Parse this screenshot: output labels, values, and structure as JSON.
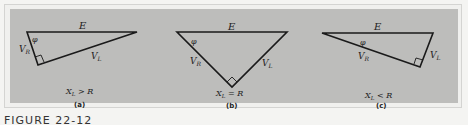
{
  "figure": {
    "caption": "FIGURE 22-12",
    "panels": [
      {
        "id": "a",
        "label": "(a)",
        "condition": "X_L > R",
        "condition_parts": {
          "lhs": "X",
          "sub": "L",
          "op": " > ",
          "rhs": "R"
        },
        "hypotenuse_label": "E",
        "angle_label": "φ",
        "side_labels": {
          "resistive": {
            "main": "V",
            "sub": "R"
          },
          "inductive": {
            "main": "V",
            "sub": "L"
          }
        }
      },
      {
        "id": "b",
        "label": "(b)",
        "condition": "X_L = R",
        "condition_parts": {
          "lhs": "X",
          "sub": "L",
          "op": " = ",
          "rhs": "R"
        },
        "hypotenuse_label": "E",
        "angle_label": "φ",
        "side_labels": {
          "resistive": {
            "main": "V",
            "sub": "R"
          },
          "inductive": {
            "main": "V",
            "sub": "L"
          }
        }
      },
      {
        "id": "c",
        "label": "(c)",
        "condition": "X_L < R",
        "condition_parts": {
          "lhs": "X",
          "sub": "L",
          "op": " < ",
          "rhs": "R"
        },
        "hypotenuse_label": "E",
        "angle_label": "φ",
        "side_labels": {
          "resistive": {
            "main": "V",
            "sub": "R"
          },
          "inductive": {
            "main": "V",
            "sub": "L"
          }
        }
      }
    ]
  },
  "colors": {
    "panel_bg": "#bdbdbb",
    "line": "#1a1a1a",
    "page_bg": "#f4f4f2"
  }
}
